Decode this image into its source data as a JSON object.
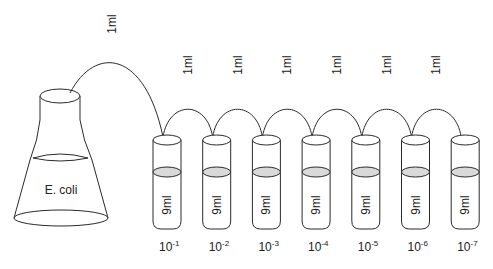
{
  "flask": {
    "label": "E. coli"
  },
  "transfer_volume": "1ml",
  "tubes": [
    {
      "volume": "9ml",
      "dilution_base": "10",
      "dilution_exp": "-1"
    },
    {
      "volume": "9ml",
      "dilution_base": "10",
      "dilution_exp": "-2"
    },
    {
      "volume": "9ml",
      "dilution_base": "10",
      "dilution_exp": "-3"
    },
    {
      "volume": "9ml",
      "dilution_base": "10",
      "dilution_exp": "-4"
    },
    {
      "volume": "9ml",
      "dilution_base": "10",
      "dilution_exp": "-5"
    },
    {
      "volume": "9ml",
      "dilution_base": "10",
      "dilution_exp": "-6"
    },
    {
      "volume": "9ml",
      "dilution_base": "10",
      "dilution_exp": "-7"
    }
  ],
  "transfers": [
    {
      "label": "1ml",
      "from": "flask",
      "to": "tube-1"
    },
    {
      "label": "1ml",
      "from": "tube-1",
      "to": "tube-2"
    },
    {
      "label": "1ml",
      "from": "tube-2",
      "to": "tube-3"
    },
    {
      "label": "1ml",
      "from": "tube-3",
      "to": "tube-4"
    },
    {
      "label": "1ml",
      "from": "tube-4",
      "to": "tube-5"
    },
    {
      "label": "1ml",
      "from": "tube-5",
      "to": "tube-6"
    },
    {
      "label": "1ml",
      "from": "tube-6",
      "to": "tube-7"
    }
  ],
  "colors": {
    "line": "#2a2a2a",
    "liquid": "#d9d9d9",
    "background": "#ffffff"
  }
}
